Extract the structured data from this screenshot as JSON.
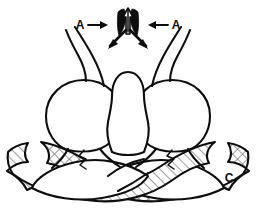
{
  "figure": {
    "background_color": "#ffffff",
    "ink_color": "#0d0d0d",
    "width": 256,
    "height": 221
  },
  "labels": [
    {
      "id": "label-a-left",
      "text": "A",
      "arrow": "→",
      "combined": "A→",
      "x": 82,
      "y": 26,
      "points": "right"
    },
    {
      "id": "label-a-right",
      "text": "A",
      "arrow": "←",
      "combined": "←A",
      "x": 172,
      "y": 26,
      "points": "left"
    },
    {
      "id": "label-c",
      "text": "C",
      "arrow": "",
      "combined": "C",
      "x": 229,
      "y": 178,
      "points": "none"
    }
  ],
  "annotations": {
    "section_line_label": "A",
    "structure_label": "C",
    "up_arrow_count": 2,
    "down_arrow_count": 2,
    "zigzag_marks": 2,
    "bulb_count": 2,
    "lens_band_count": 2
  },
  "icons": {
    "up_arrow": "up-arrow-icon",
    "down_left_arrow": "down-left-arrow-icon",
    "down_right_arrow": "down-right-arrow-icon",
    "left_pointer": "left-pointing-arrow-icon",
    "right_pointer": "right-pointing-arrow-icon",
    "zigzag": "zigzag-mark-icon"
  },
  "hatching": {
    "left_band_pattern": "diagonal",
    "right_band_pattern": "cross-hatch",
    "pattern_color": "#0d0d0d",
    "pattern_spacing_px": 7
  },
  "palette": {
    "ink": "#0d0d0d",
    "paper": "#ffffff",
    "solid_fill": "#000000"
  }
}
